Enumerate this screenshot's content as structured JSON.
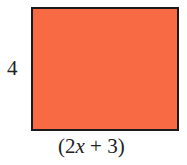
{
  "diagram": {
    "shape": "rectangle",
    "fill_color": "#f86a44",
    "border_color": "#1a1a1a",
    "height_label": "4",
    "width_label": {
      "open": "(2",
      "variable": "x",
      "rest": " + 3)"
    }
  }
}
